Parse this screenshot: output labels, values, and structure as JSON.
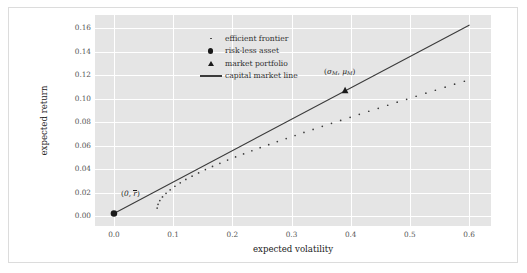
{
  "figure": {
    "background": "#ffffff",
    "frame_color": "#dcdcdc",
    "plot_background": "#e5e5e5",
    "grid_color": "#ffffff"
  },
  "legend": {
    "position": "upper-left",
    "entries": [
      {
        "label": "efficient frontier",
        "marker": "dotted-point-marker"
      },
      {
        "label": "risk-less asset",
        "marker": "filled-circle-marker"
      },
      {
        "label": "market portfolio",
        "marker": "filled-triangle-marker"
      },
      {
        "label": "capital market line",
        "marker": "solid-line-marker"
      }
    ]
  },
  "annotations": [
    {
      "name": "riskless-asset-annotation",
      "text": "(0, r̄)",
      "x": 0.012,
      "y": 0.0185
    },
    {
      "name": "market-portfolio-annotation",
      "text": "(σM, μM)",
      "x": 0.355,
      "y": 0.1225
    }
  ],
  "chart_data": {
    "type": "scatter",
    "title": "",
    "xlabel": "expected volatility",
    "ylabel": "expected return",
    "xlim": [
      -0.032,
      0.637
    ],
    "ylim": [
      -0.0085,
      0.1715
    ],
    "grid": true,
    "xticks": [
      "0.0",
      "0.1",
      "0.2",
      "0.3",
      "0.4",
      "0.5",
      "0.6"
    ],
    "xtick_values": [
      0.0,
      0.1,
      0.2,
      0.3,
      0.4,
      0.5,
      0.6
    ],
    "yticks": [
      "0.00",
      "0.02",
      "0.04",
      "0.06",
      "0.08",
      "0.10",
      "0.12",
      "0.14",
      "0.16"
    ],
    "ytick_values": [
      0.0,
      0.02,
      0.04,
      0.06,
      0.08,
      0.1,
      0.12,
      0.14,
      0.16
    ],
    "legend_position": "upper left",
    "series": [
      {
        "name": "capital market line",
        "type": "line",
        "color": "#3b3b3b",
        "linewidth": 1.1,
        "x": [
          0.0,
          0.6
        ],
        "y": [
          0.0022,
          0.1628
        ]
      },
      {
        "name": "efficient frontier",
        "type": "scatter",
        "marker": "point",
        "color": "#3b3b3b",
        "size": 1.7,
        "x": [
          0.073,
          0.0745,
          0.0775,
          0.082,
          0.088,
          0.095,
          0.103,
          0.112,
          0.1215,
          0.132,
          0.143,
          0.1545,
          0.1665,
          0.179,
          0.192,
          0.2055,
          0.219,
          0.233,
          0.247,
          0.2615,
          0.276,
          0.291,
          0.306,
          0.321,
          0.3365,
          0.352,
          0.3675,
          0.383,
          0.399,
          0.4145,
          0.4305,
          0.4465,
          0.4625,
          0.4785,
          0.4945,
          0.5105,
          0.527,
          0.543,
          0.5595,
          0.5755,
          0.592
        ],
        "y": [
          0.0068,
          0.01,
          0.0132,
          0.0163,
          0.0194,
          0.0224,
          0.0254,
          0.0283,
          0.0312,
          0.034,
          0.0368,
          0.0396,
          0.0423,
          0.045,
          0.0477,
          0.0504,
          0.053,
          0.0557,
          0.0583,
          0.0609,
          0.0635,
          0.0661,
          0.0687,
          0.0713,
          0.0739,
          0.0765,
          0.0791,
          0.0816,
          0.0842,
          0.0868,
          0.0894,
          0.0919,
          0.0945,
          0.0971,
          0.0996,
          0.1022,
          0.1048,
          0.1073,
          0.1099,
          0.1125,
          0.115
        ]
      },
      {
        "name": "risk-less asset",
        "type": "scatter",
        "marker": "circle",
        "color": "#1a1a1a",
        "size": 6.5,
        "x": [
          0.0
        ],
        "y": [
          0.0022
        ]
      },
      {
        "name": "market portfolio",
        "type": "scatter",
        "marker": "triangle",
        "color": "#1a1a1a",
        "size": 6.0,
        "x": [
          0.3905
        ],
        "y": [
          0.1072
        ]
      }
    ]
  }
}
